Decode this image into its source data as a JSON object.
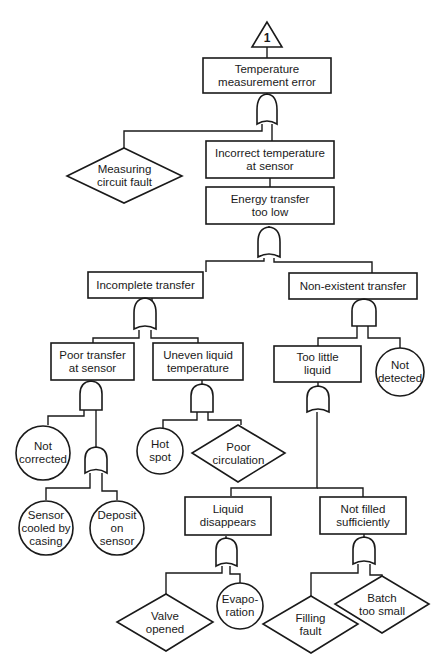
{
  "diagram": {
    "type": "fault-tree",
    "transfer_symbol": {
      "label": "1"
    },
    "nodes": {
      "top_event": {
        "label": "Temperature\nmeasurement error",
        "shape": "rectangle"
      },
      "measuring_circuit_fault": {
        "label": "Measuring\ncircuit fault",
        "shape": "diamond"
      },
      "incorrect_temp_sensor": {
        "label": "Incorrect temperature\nat sensor",
        "shape": "rectangle"
      },
      "energy_transfer_low": {
        "label": "Energy transfer\ntoo low",
        "shape": "rectangle"
      },
      "incomplete_transfer": {
        "label": "Incomplete transfer",
        "shape": "rectangle"
      },
      "non_existent_transfer": {
        "label": "Non-existent transfer",
        "shape": "rectangle"
      },
      "poor_transfer_sensor": {
        "label": "Poor transfer\nat sensor",
        "shape": "rectangle"
      },
      "uneven_liquid_temp": {
        "label": "Uneven liquid\ntemperature",
        "shape": "rectangle"
      },
      "too_little_liquid": {
        "label": "Too little\nliquid",
        "shape": "rectangle"
      },
      "not_detected": {
        "label": "Not\ndetected",
        "shape": "circle"
      },
      "not_corrected": {
        "label": "Not\ncorrected",
        "shape": "circle"
      },
      "hot_spot": {
        "label": "Hot\nspot",
        "shape": "circle"
      },
      "poor_circulation": {
        "label": "Poor\ncirculation",
        "shape": "diamond"
      },
      "sensor_cooled": {
        "label": "Sensor\ncooled by\ncasing",
        "shape": "circle"
      },
      "deposit_sensor": {
        "label": "Deposit\non\nsensor",
        "shape": "circle"
      },
      "liquid_disappears": {
        "label": "Liquid\ndisappears",
        "shape": "rectangle"
      },
      "not_filled": {
        "label": "Not filled\nsufficiently",
        "shape": "rectangle"
      },
      "valve_opened": {
        "label": "Valve\nopened",
        "shape": "diamond"
      },
      "evaporation": {
        "label": "Evapo-\nration",
        "shape": "circle"
      },
      "filling_fault": {
        "label": "Filling\nfault",
        "shape": "diamond"
      },
      "batch_too_small": {
        "label": "Batch\ntoo small",
        "shape": "diamond"
      }
    },
    "gates": {
      "g_top": {
        "type": "OR",
        "inputs": [
          "measuring_circuit_fault",
          "incorrect_temp_sensor"
        ]
      },
      "g_energy": {
        "type": "OR",
        "inputs": [
          "incomplete_transfer",
          "non_existent_transfer"
        ]
      },
      "g_incomplete": {
        "type": "OR",
        "inputs": [
          "poor_transfer_sensor",
          "uneven_liquid_temp"
        ]
      },
      "g_nonexist": {
        "type": "AND",
        "inputs": [
          "too_little_liquid",
          "not_detected"
        ]
      },
      "g_poor": {
        "type": "AND",
        "inputs": [
          "not_corrected",
          "g_sensor"
        ]
      },
      "g_sensor": {
        "type": "OR",
        "inputs": [
          "sensor_cooled",
          "deposit_sensor"
        ]
      },
      "g_uneven": {
        "type": "AND",
        "inputs": [
          "hot_spot",
          "poor_circulation"
        ]
      },
      "g_toolittle": {
        "type": "OR",
        "inputs": [
          "liquid_disappears",
          "not_filled"
        ]
      },
      "g_liquid": {
        "type": "OR",
        "inputs": [
          "valve_opened",
          "evaporation"
        ]
      },
      "g_notfilled": {
        "type": "OR",
        "inputs": [
          "filling_fault",
          "batch_too_small"
        ]
      }
    }
  }
}
